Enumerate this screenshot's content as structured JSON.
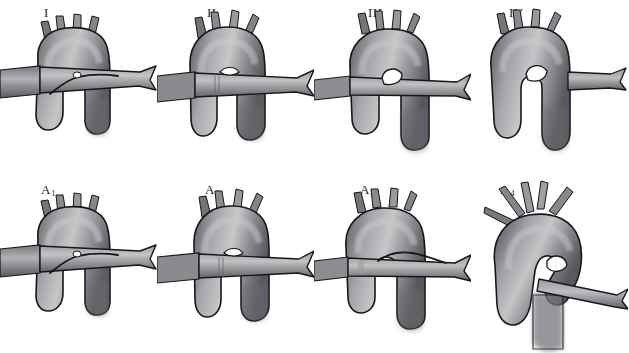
{
  "figure": {
    "background_color": "#ffffff",
    "rows": 2,
    "columns": 4,
    "total_panels": 8
  },
  "palette": {
    "outline": "#17161a",
    "vessel_dark": "#5d5d60",
    "vessel_mid": "#86868a",
    "vessel_light": "#b9b9bd",
    "vessel_highlight": "#cfcfd2",
    "shadow": "#46464a",
    "background": "#ffffff",
    "label_color": "#1c1c1c"
  },
  "panels": [
    {
      "id": "panel-1",
      "label": "I",
      "label_x": 44,
      "label_y": 8,
      "row": 1,
      "column": 1,
      "variant": "arch-anterior-crossing-vessel",
      "crossing_vessel": "full-width-horizontal",
      "branch_count": 3,
      "descending_limb": "right"
    },
    {
      "id": "panel-2",
      "label": "II",
      "label_x": 207,
      "label_y": 8,
      "row": 1,
      "column": 2,
      "variant": "arch-narrow-crossing-vessel",
      "crossing_vessel": "full-width-horizontal",
      "branch_count": 3,
      "descending_limb": "right"
    },
    {
      "id": "panel-3",
      "label": "III",
      "label_x": 368,
      "label_y": 8,
      "row": 1,
      "column": 3,
      "variant": "arch-posterior-crossing-vessel",
      "crossing_vessel": "full-width-horizontal",
      "branch_count": 3,
      "descending_limb": "right"
    },
    {
      "id": "panel-4",
      "label": "IV",
      "label_x": 509,
      "label_y": 8,
      "row": 1,
      "column": 4,
      "variant": "arch-no-crossing-vessel",
      "crossing_vessel": "right-stub-only",
      "branch_count": 3,
      "descending_limb": "right"
    },
    {
      "id": "panel-5",
      "label": "A",
      "label_sub": "1",
      "label_x": 41,
      "label_y": 196,
      "row": 2,
      "column": 1,
      "variant": "arch-anterior-crossing-vessel",
      "crossing_vessel": "full-width-horizontal",
      "branch_count": 3,
      "descending_limb": "right"
    },
    {
      "id": "panel-6",
      "label": "A",
      "label_sub": "2",
      "label_x": 205,
      "label_y": 196,
      "row": 2,
      "column": 2,
      "variant": "arch-narrow-crossing-vessel",
      "crossing_vessel": "full-width-horizontal",
      "branch_count": 3,
      "descending_limb": "right"
    },
    {
      "id": "panel-7",
      "label": "A",
      "label_sub": "3",
      "label_x": 360,
      "label_y": 196,
      "row": 2,
      "column": 3,
      "variant": "arch-posterior-crossing-vessel",
      "crossing_vessel": "full-width-horizontal",
      "branch_count": 3,
      "descending_limb": "right"
    },
    {
      "id": "panel-8",
      "label": "A",
      "label_sub": "4",
      "label_x": 500,
      "label_y": 196,
      "row": 2,
      "column": 4,
      "variant": "arch-oblique-view-splayed-branches",
      "crossing_vessel": "oblique-right",
      "branch_count": 4,
      "descending_limb": "center"
    }
  ]
}
